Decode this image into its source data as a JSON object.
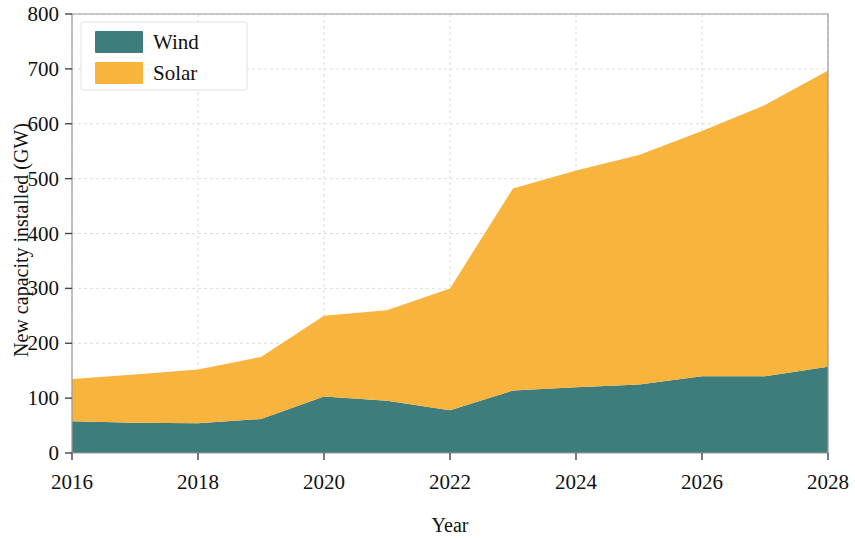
{
  "chart_data": {
    "type": "area",
    "title": "",
    "xlabel": "Year",
    "ylabel": "New capacity installed (GW)",
    "stacked": true,
    "grid": true,
    "legend_position": "top-left",
    "x": [
      2016,
      2017,
      2018,
      2019,
      2020,
      2021,
      2022,
      2023,
      2024,
      2025,
      2026,
      2027,
      2028
    ],
    "categories": [
      "2016",
      "2017",
      "2018",
      "2019",
      "2020",
      "2021",
      "2022",
      "2023",
      "2024",
      "2025",
      "2026",
      "2027",
      "2028"
    ],
    "series": [
      {
        "name": "Wind",
        "color": "#3f7d7d",
        "values": [
          58,
          55,
          54,
          62,
          103,
          95,
          78,
          114,
          120,
          125,
          140,
          140,
          157
        ]
      },
      {
        "name": "Solar",
        "color": "#f8b43c",
        "values": [
          77,
          88,
          98,
          113,
          147,
          165,
          222,
          368,
          395,
          418,
          447,
          494,
          540
        ]
      }
    ],
    "totals": [
      135,
      143,
      152,
      175,
      250,
      260,
      300,
      482,
      515,
      543,
      587,
      634,
      697
    ],
    "xlim": [
      2016,
      2028
    ],
    "ylim": [
      0,
      800
    ],
    "xticks": [
      2016,
      2018,
      2020,
      2022,
      2024,
      2026,
      2028
    ],
    "xtick_labels": [
      "2016",
      "2018",
      "2020",
      "2022",
      "2024",
      "2026",
      "2028"
    ],
    "yticks": [
      0,
      100,
      200,
      300,
      400,
      500,
      600,
      700,
      800
    ],
    "ytick_labels": [
      "0",
      "100",
      "200",
      "300",
      "400",
      "500",
      "600",
      "700",
      "800"
    ]
  },
  "legend": {
    "entries": [
      {
        "label": "Wind",
        "color": "#3f7d7d"
      },
      {
        "label": "Solar",
        "color": "#f8b43c"
      }
    ]
  },
  "axes": {
    "x_title": "Year",
    "y_title": "New capacity installed (GW)"
  }
}
